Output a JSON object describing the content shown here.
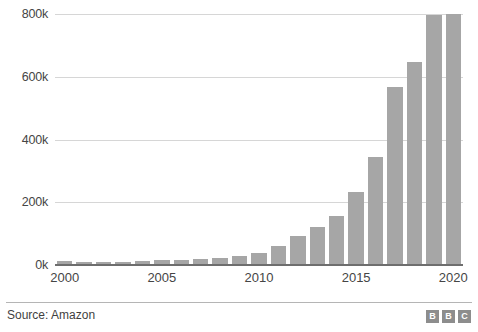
{
  "chart_data": {
    "type": "bar",
    "title": "",
    "subtitle": "",
    "xlabel": "",
    "ylabel": "",
    "categories": [
      "2000",
      "2001",
      "2002",
      "2003",
      "2004",
      "2005",
      "2006",
      "2007",
      "2008",
      "2009",
      "2010",
      "2011",
      "2012",
      "2013",
      "2014",
      "2015",
      "2016",
      "2017",
      "2018",
      "2019",
      "2020"
    ],
    "values": [
      9000,
      7800,
      7500,
      7800,
      9000,
      12000,
      13900,
      17000,
      20700,
      24300,
      33700,
      56200,
      88400,
      117300,
      154100,
      230800,
      341400,
      566000,
      647500,
      798000,
      1298000
    ],
    "ylim": [
      0,
      800000
    ],
    "yticks": [
      0,
      200000,
      400000,
      600000,
      800000
    ],
    "ytick_labels": [
      "0k",
      "200k",
      "400k",
      "600k",
      "800k"
    ],
    "xtick_labels": [
      "2000",
      "2005",
      "2010",
      "2015",
      "2020"
    ],
    "xtick_categories": [
      "2000",
      "2005",
      "2010",
      "2015",
      "2020"
    ],
    "grid": true,
    "legend": false,
    "bar_color": "#a6a6a6",
    "gridline_color": "#d6d6d6",
    "axis_color": "#6e6e6e"
  },
  "footer": {
    "source": "Source: Amazon",
    "logo_letters": [
      "B",
      "B",
      "C"
    ]
  }
}
